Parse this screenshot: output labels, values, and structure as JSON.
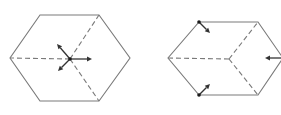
{
  "figure": {
    "panels": [
      {
        "id": "left",
        "description": "Hexagon with dashed lines from center to three vertices; three force arrows at center",
        "vertices": [
          [
            40,
            15
          ],
          [
            99,
            15
          ],
          [
            130,
            58
          ],
          [
            99,
            101
          ],
          [
            40,
            101
          ],
          [
            10,
            58
          ]
        ],
        "center": [
          70,
          59
        ],
        "dashed_to": [
          [
            10,
            58
          ],
          [
            99,
            15
          ],
          [
            99,
            101
          ]
        ],
        "center_dot": true,
        "arrows": [
          {
            "from": [
              70,
              59
            ],
            "to": [
              92,
              59
            ]
          },
          {
            "from": [
              70,
              59
            ],
            "to": [
              57,
              44
            ]
          },
          {
            "from": [
              70,
              59
            ],
            "to": [
              58,
              71
            ]
          }
        ]
      },
      {
        "id": "right",
        "description": "Hexagon with dashed lines from center to three vertices; arrows at two vertices and one edge",
        "vertices": [
          [
            199,
            22
          ],
          [
            258,
            22
          ],
          [
            283,
            58
          ],
          [
            258,
            95
          ],
          [
            199,
            95
          ],
          [
            168,
            58
          ]
        ],
        "center": [
          229,
          59
        ],
        "dashed_to": [
          [
            168,
            58
          ],
          [
            258,
            22
          ],
          [
            258,
            95
          ]
        ],
        "dots": [
          [
            199,
            22
          ],
          [
            199,
            95
          ]
        ],
        "arrows": [
          {
            "from": [
              199,
              22
            ],
            "to": [
              210,
              33
            ]
          },
          {
            "from": [
              199,
              95
            ],
            "to": [
              210,
              84
            ]
          },
          {
            "from": [
              281,
              58
            ],
            "to": [
              265,
              58
            ]
          }
        ]
      }
    ],
    "colors": {
      "edge": "#7a7a7a",
      "arrow": "#333333",
      "dot": "#1a1a1a",
      "background": "#ffffff"
    }
  }
}
